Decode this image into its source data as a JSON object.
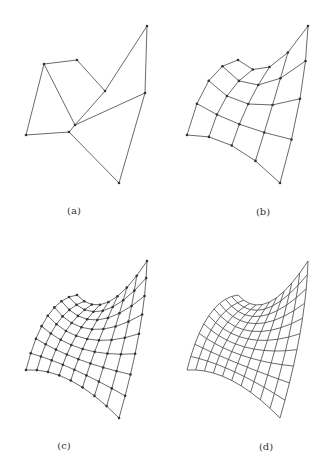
{
  "figure": {
    "panels": [
      {
        "id": "a",
        "label": "(a)",
        "description": "control polygon net",
        "offset": [
          0,
          0
        ]
      },
      {
        "id": "b",
        "label": "(b)",
        "description": "subdivided net level 1",
        "offset": [
          161,
          0
        ]
      },
      {
        "id": "c",
        "label": "(c)",
        "description": "subdivided net level 2",
        "offset": [
          0,
          235
        ]
      },
      {
        "id": "d",
        "label": "(d)",
        "description": "limit surface grid",
        "offset": [
          161,
          235
        ]
      }
    ],
    "control_net": [
      [
        [
          26,
          135
        ],
        [
          44,
          64
        ],
        [
          77,
          60
        ]
      ],
      [
        [
          69,
          132
        ],
        [
          75,
          125
        ],
        [
          105,
          91
        ]
      ],
      [
        [
          119,
          183
        ],
        [
          145,
          93
        ],
        [
          147,
          26
        ]
      ]
    ],
    "colors": {
      "line": "#444444",
      "point": "#333333"
    }
  }
}
